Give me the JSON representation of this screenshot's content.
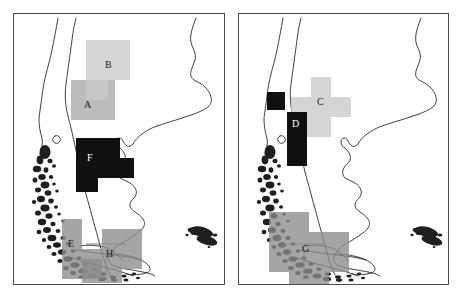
{
  "figure": {
    "title": "",
    "panel_count": 2,
    "background_color": "#ffffff",
    "border_color": "#4a4a4a"
  },
  "palette": {
    "light_gray": "#c9c9c9",
    "medium_gray": "#a8a8a8",
    "dark_gray": "#8c8c8c",
    "black": "#101010",
    "coastline": "#2b2b2b",
    "white": "#ffffff"
  },
  "panels": [
    {
      "id": "panel-left",
      "name": "left-map-panel",
      "region": "Southern South America",
      "clusters": [
        {
          "label": "A",
          "name": "cluster-a",
          "shade": "medium_gray",
          "color": "#a8a8a8",
          "label_x": 70,
          "label_y": 86,
          "label_on_dark": false,
          "cells": [
            {
              "x": 57,
              "y": 66,
              "w": 22,
              "h": 20
            },
            {
              "x": 57,
              "y": 86,
              "w": 22,
              "h": 20
            },
            {
              "x": 79,
              "y": 66,
              "w": 22,
              "h": 20
            },
            {
              "x": 79,
              "y": 86,
              "w": 22,
              "h": 20
            }
          ]
        },
        {
          "label": "B",
          "name": "cluster-b",
          "shade": "light_gray",
          "color": "#c9c9c9",
          "label_x": 91,
          "label_y": 46,
          "label_on_dark": false,
          "cells": [
            {
              "x": 72,
              "y": 26,
              "w": 22,
              "h": 20
            },
            {
              "x": 94,
              "y": 26,
              "w": 22,
              "h": 20
            },
            {
              "x": 72,
              "y": 46,
              "w": 22,
              "h": 20
            },
            {
              "x": 94,
              "y": 46,
              "w": 22,
              "h": 20
            },
            {
              "x": 72,
              "y": 66,
              "w": 22,
              "h": 20
            }
          ]
        },
        {
          "label": "F",
          "name": "cluster-f",
          "shade": "black",
          "color": "#101010",
          "label_x": 73,
          "label_y": 139,
          "label_on_dark": true,
          "cells": [
            {
              "x": 62,
              "y": 124,
              "w": 22,
              "h": 20
            },
            {
              "x": 62,
              "y": 144,
              "w": 22,
              "h": 20
            },
            {
              "x": 84,
              "y": 124,
              "w": 22,
              "h": 20
            },
            {
              "x": 84,
              "y": 144,
              "w": 22,
              "h": 20
            },
            {
              "x": 62,
              "y": 164,
              "w": 22,
              "h": 14
            },
            {
              "x": 106,
              "y": 144,
              "w": 14,
              "h": 20
            }
          ]
        },
        {
          "label": "E",
          "name": "cluster-e",
          "shade": "dark_gray",
          "color": "#8c8c8c",
          "label_x": 54,
          "label_y": 225,
          "label_on_dark": false,
          "cells": [
            {
              "x": 48,
              "y": 205,
              "w": 20,
              "h": 20
            },
            {
              "x": 48,
              "y": 225,
              "w": 20,
              "h": 20
            },
            {
              "x": 48,
              "y": 245,
              "w": 20,
              "h": 20
            },
            {
              "x": 68,
              "y": 245,
              "w": 20,
              "h": 20
            }
          ]
        },
        {
          "label": "H",
          "name": "cluster-h",
          "shade": "dark_gray",
          "color": "#8c8c8c",
          "label_x": 92,
          "label_y": 235,
          "label_on_dark": false,
          "cells": [
            {
              "x": 88,
              "y": 215,
              "w": 20,
              "h": 20
            },
            {
              "x": 68,
              "y": 235,
              "w": 20,
              "h": 20
            },
            {
              "x": 88,
              "y": 235,
              "w": 20,
              "h": 20
            },
            {
              "x": 108,
              "y": 235,
              "w": 20,
              "h": 20
            },
            {
              "x": 108,
              "y": 215,
              "w": 20,
              "h": 20
            },
            {
              "x": 88,
              "y": 255,
              "w": 20,
              "h": 14
            },
            {
              "x": 68,
              "y": 255,
              "w": 20,
              "h": 14
            }
          ]
        }
      ]
    },
    {
      "id": "panel-right",
      "name": "right-map-panel",
      "region": "Southern South America",
      "clusters": [
        {
          "label": "C",
          "name": "cluster-c",
          "shade": "light_gray",
          "color": "#c9c9c9",
          "label_x": 78,
          "label_y": 83,
          "label_on_dark": false,
          "cells": [
            {
              "x": 72,
              "y": 63,
              "w": 20,
              "h": 20
            },
            {
              "x": 72,
              "y": 83,
              "w": 20,
              "h": 20
            },
            {
              "x": 92,
              "y": 83,
              "w": 20,
              "h": 20
            },
            {
              "x": 52,
              "y": 83,
              "w": 20,
              "h": 20
            },
            {
              "x": 72,
              "y": 103,
              "w": 20,
              "h": 20
            },
            {
              "x": 52,
              "y": 103,
              "w": 20,
              "h": 20
            }
          ]
        },
        {
          "label": "D",
          "name": "cluster-d",
          "shade": "black",
          "color": "#101010",
          "label_x": 53,
          "label_y": 105,
          "label_on_dark": true,
          "cells": [
            {
              "x": 28,
              "y": 78,
              "w": 18,
              "h": 18
            },
            {
              "x": 48,
              "y": 98,
              "w": 20,
              "h": 20
            },
            {
              "x": 48,
              "y": 118,
              "w": 20,
              "h": 20
            },
            {
              "x": 48,
              "y": 138,
              "w": 20,
              "h": 14
            }
          ]
        },
        {
          "label": "G",
          "name": "cluster-g",
          "shade": "dark_gray",
          "color": "#8c8c8c",
          "label_x": 63,
          "label_y": 230,
          "label_on_dark": false,
          "cells": [
            {
              "x": 30,
              "y": 198,
              "w": 20,
              "h": 20
            },
            {
              "x": 50,
              "y": 198,
              "w": 20,
              "h": 20
            },
            {
              "x": 30,
              "y": 218,
              "w": 20,
              "h": 20
            },
            {
              "x": 50,
              "y": 218,
              "w": 20,
              "h": 20
            },
            {
              "x": 70,
              "y": 218,
              "w": 20,
              "h": 20
            },
            {
              "x": 90,
              "y": 218,
              "w": 20,
              "h": 20
            },
            {
              "x": 30,
              "y": 238,
              "w": 20,
              "h": 20
            },
            {
              "x": 50,
              "y": 238,
              "w": 20,
              "h": 20
            },
            {
              "x": 70,
              "y": 238,
              "w": 20,
              "h": 20
            },
            {
              "x": 90,
              "y": 238,
              "w": 20,
              "h": 20
            },
            {
              "x": 50,
              "y": 258,
              "w": 20,
              "h": 14
            },
            {
              "x": 70,
              "y": 258,
              "w": 20,
              "h": 14
            }
          ]
        }
      ]
    }
  ]
}
